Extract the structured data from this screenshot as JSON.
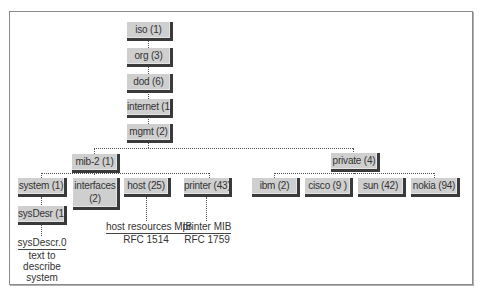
{
  "diagram": {
    "type": "tree",
    "root_chain": [
      {
        "id": "iso",
        "label": "iso (1)"
      },
      {
        "id": "org",
        "label": "org (3)"
      },
      {
        "id": "dod",
        "label": "dod (6)"
      },
      {
        "id": "internet",
        "label": "internet (1)"
      },
      {
        "id": "mgmt",
        "label": "mgmt (2)"
      }
    ],
    "mgmt_children": [
      {
        "id": "mib-2",
        "label": "mib-2 (1)"
      },
      {
        "id": "private",
        "label": "private (4)"
      }
    ],
    "mib2_children": [
      {
        "id": "system",
        "label": "system (1)"
      },
      {
        "id": "interfaces",
        "label": "interfaces (2)",
        "line1": "interfaces",
        "line2": "(2)"
      },
      {
        "id": "host",
        "label": "host (25)"
      },
      {
        "id": "printer",
        "label": "printer (43)"
      }
    ],
    "private_children": [
      {
        "id": "ibm",
        "label": "ibm (2)"
      },
      {
        "id": "cisco",
        "label": "cisco (9 )"
      },
      {
        "id": "sun",
        "label": "sun (42)"
      },
      {
        "id": "nokia",
        "label": "nokia (94)"
      }
    ],
    "system_children": [
      {
        "id": "sysDesr",
        "label": "sysDesr (1)"
      }
    ],
    "annotations": {
      "sysdescr": {
        "title": "sysDescr.0",
        "line1": "text to",
        "line2": "describe",
        "line3": "system"
      },
      "host": {
        "title": "host resources MIB",
        "sub": "RFC 1514"
      },
      "printer": {
        "title": "printer MIB",
        "sub": "RFC 1759"
      }
    }
  }
}
